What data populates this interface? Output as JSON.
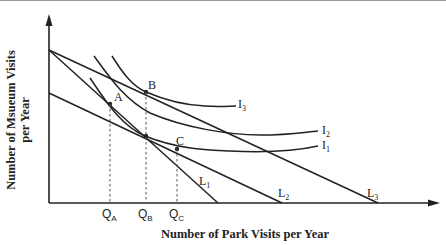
{
  "diagram": {
    "type": "indifference-curve-budget-line",
    "axes": {
      "y_label": "Number of Msueum Visits per Year",
      "x_label": "Number of Park Visits per Year"
    },
    "points": [
      {
        "id": "A",
        "label": "A"
      },
      {
        "id": "B",
        "label": "B"
      },
      {
        "id": "C",
        "label": "C"
      }
    ],
    "quantities": [
      {
        "base": "Q",
        "sub": "A"
      },
      {
        "base": "Q",
        "sub": "B"
      },
      {
        "base": "Q",
        "sub": "C"
      }
    ],
    "budget_lines": [
      {
        "base": "L",
        "sub": "1"
      },
      {
        "base": "L",
        "sub": "2"
      },
      {
        "base": "L",
        "sub": "3"
      }
    ],
    "indifference_curves": [
      {
        "base": "I",
        "sub": "1"
      },
      {
        "base": "I",
        "sub": "2"
      },
      {
        "base": "I",
        "sub": "3"
      }
    ],
    "line_color": "#222222",
    "dash_color": "#555555"
  }
}
